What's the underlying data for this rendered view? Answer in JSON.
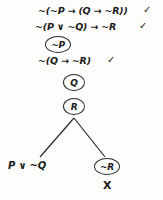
{
  "diagram": {
    "type": "truth-tree",
    "title": "",
    "background_color": "#fdfdfb",
    "ink_color": "#1b1b1b",
    "stem": [
      {
        "id": "line1",
        "text": "~(~P → (Q → ~R))",
        "check": "✓",
        "circled": false
      },
      {
        "id": "line2",
        "text": "~(P ∨ ~Q) → ~R",
        "check": "✓",
        "circled": false
      },
      {
        "id": "line3",
        "text": "~P",
        "check": "",
        "circled": true
      },
      {
        "id": "line4",
        "text": "~(Q → ~R)",
        "check": "✓",
        "circled": false
      },
      {
        "id": "line5",
        "text": "Q",
        "check": "",
        "circled": true
      },
      {
        "id": "line6",
        "text": "R",
        "check": "",
        "circled": true
      }
    ],
    "branches": {
      "left": {
        "id": "branch-left",
        "text": "P ∨ ~Q",
        "circled": false,
        "closed": false,
        "closed_mark": ""
      },
      "right": {
        "id": "branch-right",
        "text": "~R",
        "circled": true,
        "closed": true,
        "closed_mark": "X"
      }
    }
  }
}
